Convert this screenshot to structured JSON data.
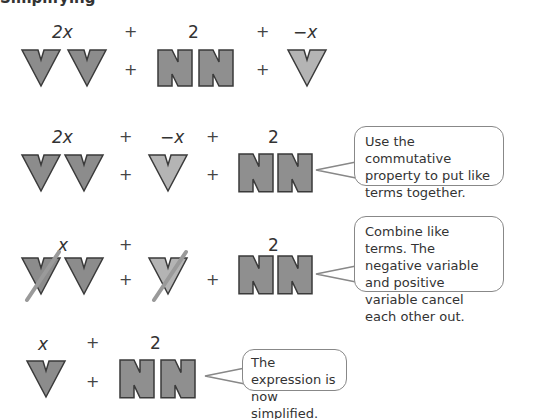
{
  "title": "Simplifying",
  "colors": {
    "variable_positive": "#8c8c8c",
    "variable_negative": "#b4b4b4",
    "constant": "#8f8f8f",
    "outline": "#3a3a3a",
    "strike": "#9a9a9a",
    "bubble_border": "#888888"
  },
  "rows": [
    {
      "labels": [
        "2x",
        "+",
        "2",
        "+",
        "−x"
      ],
      "ops": [
        "+",
        "+"
      ]
    },
    {
      "labels": [
        "2x",
        "+",
        "−x",
        "+",
        "2"
      ],
      "ops": [
        "+",
        "+"
      ],
      "callout": "Use the commutative property to put like terms together."
    },
    {
      "labels": [
        "x",
        "+",
        "2"
      ],
      "ops": [
        "+",
        "+"
      ],
      "callout": "Combine like terms. The negative variable and positive variable cancel each other out."
    },
    {
      "labels": [
        "x",
        "+",
        "2"
      ],
      "ops": [
        "+"
      ],
      "callout": "The expression is now simplified."
    }
  ]
}
